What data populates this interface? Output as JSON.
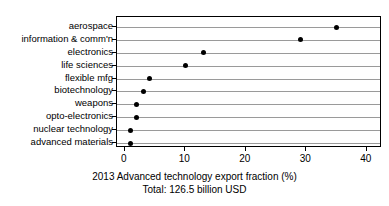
{
  "chart_data": {
    "type": "scatter",
    "variant": "cleveland-dot-plot",
    "orientation": "horizontal",
    "title": "",
    "xlabel": "2013 Advanced technology export fraction (%)",
    "ylabel": "",
    "caption_line1": "2013 Advanced technology export fraction (%)",
    "caption_line2": "Total: 126.5 billion USD",
    "categories": [
      "aerospace",
      "information & comm'n",
      "electronics",
      "life sciences",
      "flexible mfg",
      "biotechnology",
      "weapons",
      "opto-electronics",
      "nuclear technology",
      "advanced materials"
    ],
    "values": [
      35,
      29,
      13,
      10,
      4,
      3,
      2,
      2,
      1,
      1
    ],
    "xlim": [
      -1.3,
      42.5
    ],
    "xticks": [
      0,
      10,
      20,
      30,
      40
    ],
    "xtick_labels": [
      "0",
      "10",
      "20",
      "30",
      "40"
    ],
    "grid": "horizontal",
    "legend": "none",
    "total_label": "Total: 126.5 billion USD",
    "total_value": 126.5,
    "total_units": "billion USD",
    "year": "2013",
    "colors": {
      "dot": "#000000",
      "gridline": "#9a9a9a",
      "frame": "#000000",
      "background": "#ffffff",
      "text": "#000000"
    }
  }
}
